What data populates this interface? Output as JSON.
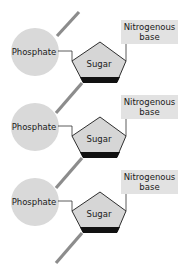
{
  "diagram": {
    "title": "",
    "colors": {
      "phosphate_fill": "#d9d9d9",
      "sugar_fill": "#d6d6d6",
      "sugar_outline": "#1a1a1a",
      "base_fill": "#e2e2e2",
      "backbone_line": "#8c8c8c",
      "connector_line": "#333333"
    },
    "units": [
      {
        "phosphate_label": "Phosphate",
        "sugar_label": "Sugar",
        "base_label_line1": "Nitrogenous",
        "base_label_line2": "base"
      },
      {
        "phosphate_label": "Phosphate",
        "sugar_label": "Sugar",
        "base_label_line1": "Nitrogenous",
        "base_label_line2": "base"
      },
      {
        "phosphate_label": "Phosphate",
        "sugar_label": "Sugar",
        "base_label_line1": "Nitrogenous",
        "base_label_line2": "base"
      }
    ]
  }
}
